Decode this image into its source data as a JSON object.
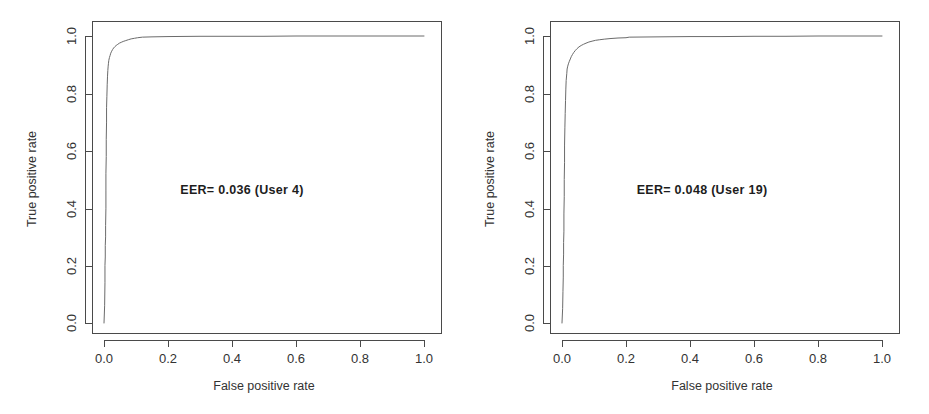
{
  "figure": {
    "background_color": "#ffffff",
    "line_color": "#6b6b6b",
    "axis_color": "#4a4a4a",
    "text_color": "#333333"
  },
  "chart_data": [
    {
      "type": "line",
      "title": "",
      "annotation": "EER= 0.036  (User 4)",
      "eer": 0.036,
      "user": "User 4",
      "xlabel": "False positive rate",
      "ylabel": "True positive rate",
      "xlim": [
        0.0,
        1.0
      ],
      "ylim": [
        0.0,
        1.0
      ],
      "xticks": [
        "0.0",
        "0.2",
        "0.4",
        "0.6",
        "0.8",
        "1.0"
      ],
      "yticks": [
        "0.0",
        "0.2",
        "0.4",
        "0.6",
        "0.8",
        "1.0"
      ],
      "xtick_values": [
        0.0,
        0.2,
        0.4,
        0.6,
        0.8,
        1.0
      ],
      "ytick_values": [
        0.0,
        0.2,
        0.4,
        0.6,
        0.8,
        1.0
      ],
      "grid": false,
      "legend": "none",
      "series": [
        {
          "name": "ROC curve (User 4)",
          "x": [
            0.0,
            0.002,
            0.003,
            0.003,
            0.004,
            0.004,
            0.005,
            0.005,
            0.006,
            0.006,
            0.006,
            0.007,
            0.007,
            0.008,
            0.008,
            0.009,
            0.01,
            0.011,
            0.012,
            0.013,
            0.014,
            0.015,
            0.017,
            0.019,
            0.021,
            0.024,
            0.027,
            0.03,
            0.034,
            0.038,
            0.043,
            0.048,
            0.054,
            0.06,
            0.068,
            0.076,
            0.085,
            0.095,
            0.105,
            0.12,
            0.15,
            0.2,
            0.3,
            0.4,
            0.5,
            0.6,
            0.7,
            0.8,
            0.9,
            1.0
          ],
          "y": [
            0.0,
            0.06,
            0.14,
            0.2,
            0.23,
            0.27,
            0.3,
            0.34,
            0.4,
            0.46,
            0.52,
            0.58,
            0.64,
            0.7,
            0.75,
            0.79,
            0.83,
            0.86,
            0.88,
            0.895,
            0.905,
            0.915,
            0.925,
            0.932,
            0.94,
            0.947,
            0.953,
            0.958,
            0.963,
            0.967,
            0.971,
            0.975,
            0.978,
            0.981,
            0.984,
            0.987,
            0.99,
            0.992,
            0.994,
            0.996,
            0.997,
            0.998,
            0.999,
            0.999,
            0.999,
            1.0,
            1.0,
            1.0,
            1.0,
            1.0
          ]
        }
      ]
    },
    {
      "type": "line",
      "title": "",
      "annotation": "EER= 0.048 (User 19)",
      "eer": 0.048,
      "user": "User 19",
      "xlabel": "False positive rate",
      "ylabel": "True positive rate",
      "xlim": [
        0.0,
        1.0
      ],
      "ylim": [
        0.0,
        1.0
      ],
      "xticks": [
        "0.0",
        "0.2",
        "0.4",
        "0.6",
        "0.8",
        "1.0"
      ],
      "yticks": [
        "0.0",
        "0.2",
        "0.4",
        "0.6",
        "0.8",
        "1.0"
      ],
      "xtick_values": [
        0.0,
        0.2,
        0.4,
        0.6,
        0.8,
        1.0
      ],
      "ytick_values": [
        0.0,
        0.2,
        0.4,
        0.6,
        0.8,
        1.0
      ],
      "grid": false,
      "legend": "none",
      "series": [
        {
          "name": "ROC curve (User 19)",
          "x": [
            0.0,
            0.002,
            0.003,
            0.004,
            0.004,
            0.005,
            0.005,
            0.006,
            0.006,
            0.007,
            0.007,
            0.008,
            0.008,
            0.009,
            0.01,
            0.011,
            0.012,
            0.013,
            0.015,
            0.016,
            0.018,
            0.02,
            0.023,
            0.026,
            0.029,
            0.033,
            0.037,
            0.042,
            0.047,
            0.053,
            0.06,
            0.067,
            0.075,
            0.084,
            0.094,
            0.105,
            0.118,
            0.132,
            0.15,
            0.175,
            0.2,
            0.21,
            0.3,
            0.4,
            0.5,
            0.6,
            0.7,
            0.8,
            0.9,
            1.0
          ],
          "y": [
            0.0,
            0.05,
            0.11,
            0.16,
            0.2,
            0.24,
            0.28,
            0.32,
            0.38,
            0.44,
            0.5,
            0.56,
            0.62,
            0.68,
            0.73,
            0.775,
            0.815,
            0.845,
            0.87,
            0.885,
            0.895,
            0.903,
            0.912,
            0.92,
            0.928,
            0.936,
            0.943,
            0.95,
            0.956,
            0.962,
            0.967,
            0.971,
            0.975,
            0.979,
            0.982,
            0.985,
            0.987,
            0.989,
            0.991,
            0.993,
            0.994,
            0.996,
            0.997,
            0.998,
            0.998,
            0.999,
            0.999,
            1.0,
            1.0,
            1.0
          ]
        }
      ]
    }
  ]
}
